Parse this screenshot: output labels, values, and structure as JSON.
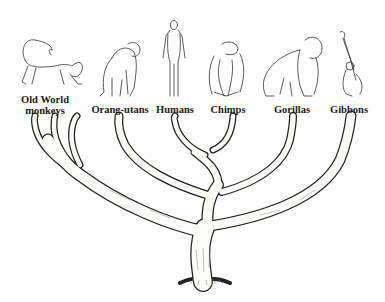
{
  "diagram": {
    "type": "phylogenetic-tree",
    "colors": {
      "background": "#ffffff",
      "ink": "#222222",
      "branch_fill": "#fbfbf8"
    },
    "taxa": [
      {
        "id": "old-world-monkeys",
        "label_line1": "Old World",
        "label_line2": "monkeys",
        "icon": "monkey-icon"
      },
      {
        "id": "orang-utans",
        "label_line1": "Orang-utans",
        "label_line2": "",
        "icon": "orangutan-icon"
      },
      {
        "id": "humans",
        "label_line1": "Humans",
        "label_line2": "",
        "icon": "human-icon"
      },
      {
        "id": "chimps",
        "label_line1": "Chimps",
        "label_line2": "",
        "icon": "chimpanzee-icon"
      },
      {
        "id": "gorillas",
        "label_line1": "Gorillas",
        "label_line2": "",
        "icon": "gorilla-icon"
      },
      {
        "id": "gibbons",
        "label_line1": "Gibbons",
        "label_line2": "",
        "icon": "gibbon-icon"
      }
    ]
  }
}
